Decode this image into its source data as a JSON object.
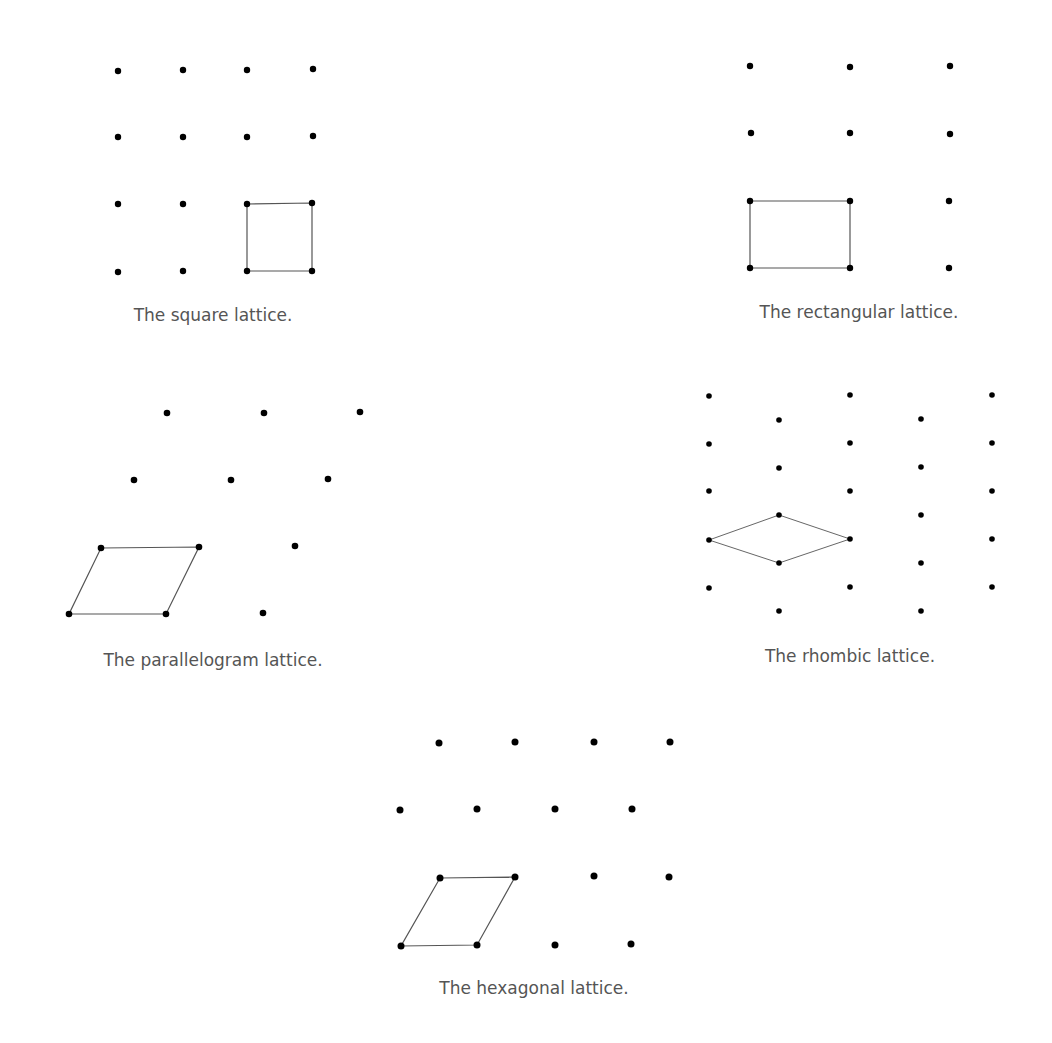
{
  "figure": {
    "dot_color": "#000000",
    "line_color": "#555555",
    "caption_color": "#555555"
  },
  "lattices": [
    {
      "id": "square",
      "caption": "The square lattice.",
      "caption_pos": [
        213,
        317
      ],
      "dot_radius": 3.2,
      "points": [
        [
          118,
          71
        ],
        [
          183,
          70
        ],
        [
          247,
          70
        ],
        [
          313,
          69
        ],
        [
          118,
          137
        ],
        [
          183,
          137
        ],
        [
          247,
          137
        ],
        [
          313,
          136
        ],
        [
          118,
          204
        ],
        [
          183,
          204
        ],
        [
          247,
          204
        ],
        [
          312,
          203
        ],
        [
          118,
          272
        ],
        [
          183,
          271
        ],
        [
          247,
          271
        ],
        [
          312,
          271
        ]
      ],
      "cell": [
        [
          247,
          204
        ],
        [
          312,
          203
        ],
        [
          312,
          271
        ],
        [
          247,
          271
        ]
      ],
      "line_width": 1.2
    },
    {
      "id": "rectangular",
      "caption": "The rectangular lattice.",
      "caption_pos": [
        859,
        314
      ],
      "dot_radius": 3.2,
      "points": [
        [
          750,
          66
        ],
        [
          850,
          67
        ],
        [
          950,
          66
        ],
        [
          751,
          133
        ],
        [
          850,
          133
        ],
        [
          950,
          134
        ],
        [
          750,
          201
        ],
        [
          850,
          201
        ],
        [
          949,
          201
        ],
        [
          750,
          268
        ],
        [
          850,
          268
        ],
        [
          949,
          268
        ]
      ],
      "cell": [
        [
          750,
          201
        ],
        [
          850,
          201
        ],
        [
          850,
          268
        ],
        [
          750,
          268
        ]
      ],
      "line_width": 1.2
    },
    {
      "id": "parallelogram",
      "caption": "The parallelogram lattice.",
      "caption_pos": [
        213,
        662
      ],
      "dot_radius": 3.3,
      "points": [
        [
          167,
          413
        ],
        [
          264,
          413
        ],
        [
          360,
          412
        ],
        [
          134,
          480
        ],
        [
          231,
          480
        ],
        [
          328,
          479
        ],
        [
          101,
          548
        ],
        [
          199,
          547
        ],
        [
          295,
          546
        ],
        [
          69,
          614
        ],
        [
          166,
          614
        ],
        [
          263,
          613
        ]
      ],
      "cell": [
        [
          101,
          548
        ],
        [
          199,
          547
        ],
        [
          166,
          614
        ],
        [
          69,
          614
        ]
      ],
      "line_width": 1.2
    },
    {
      "id": "rhombic",
      "caption": "The rhombic lattice.",
      "caption_pos": [
        850,
        658
      ],
      "dot_radius": 2.8,
      "points": [
        [
          709,
          396
        ],
        [
          850,
          395
        ],
        [
          992,
          395
        ],
        [
          779,
          420
        ],
        [
          921,
          419
        ],
        [
          709,
          444
        ],
        [
          850,
          443
        ],
        [
          992,
          443
        ],
        [
          779,
          468
        ],
        [
          921,
          467
        ],
        [
          709,
          491
        ],
        [
          850,
          491
        ],
        [
          992,
          491
        ],
        [
          779,
          515
        ],
        [
          921,
          515
        ],
        [
          709,
          540
        ],
        [
          850,
          539
        ],
        [
          992,
          539
        ],
        [
          779,
          563
        ],
        [
          921,
          563
        ],
        [
          709,
          588
        ],
        [
          850,
          587
        ],
        [
          992,
          587
        ],
        [
          779,
          611
        ],
        [
          921,
          611
        ]
      ],
      "cell": [
        [
          709,
          540
        ],
        [
          779,
          515
        ],
        [
          850,
          539
        ],
        [
          779,
          563
        ]
      ],
      "line_width": 0.9
    },
    {
      "id": "hexagonal",
      "caption": "The hexagonal lattice.",
      "caption_pos": [
        534,
        990
      ],
      "dot_radius": 3.5,
      "points": [
        [
          439,
          743
        ],
        [
          515,
          742
        ],
        [
          594,
          742
        ],
        [
          670,
          742
        ],
        [
          400,
          810
        ],
        [
          477,
          809
        ],
        [
          555,
          809
        ],
        [
          632,
          809
        ],
        [
          440,
          878
        ],
        [
          515,
          877
        ],
        [
          594,
          876
        ],
        [
          669,
          877
        ],
        [
          401,
          946
        ],
        [
          477,
          945
        ],
        [
          555,
          945
        ],
        [
          631,
          944
        ]
      ],
      "cell": [
        [
          440,
          878
        ],
        [
          515,
          877
        ],
        [
          477,
          945
        ],
        [
          401,
          946
        ]
      ],
      "line_width": 1.2
    }
  ]
}
